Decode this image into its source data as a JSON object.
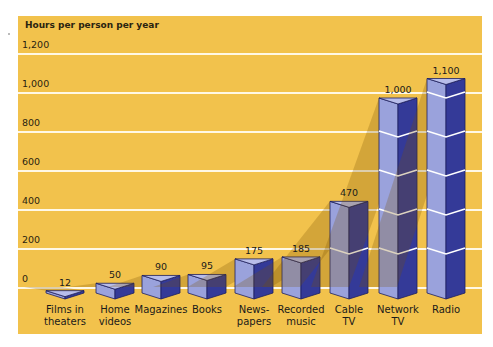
{
  "chart_data": {
    "type": "bar",
    "title": "",
    "ylabel": "Hours per person per year",
    "xlabel": "",
    "ylim": [
      0,
      1200
    ],
    "yticks": [
      "0",
      "200",
      "400",
      "600",
      "800",
      "1,000",
      "1,200"
    ],
    "grid": true,
    "categories": [
      "Films in theaters",
      "Home videos",
      "Magazines",
      "Books",
      "News-papers",
      "Recorded music",
      "Cable TV",
      "Network TV",
      "Radio"
    ],
    "values": [
      12,
      50,
      90,
      95,
      175,
      185,
      470,
      1000,
      1100
    ],
    "value_labels": [
      "12",
      "50",
      "90",
      "95",
      "175",
      "185",
      "470",
      "1,000",
      "1,100"
    ],
    "colors": {
      "background": "#f2c24c",
      "bar_light": "#a8b0e6",
      "bar_dark": "#2e3492",
      "gridline": "#fff8e6"
    }
  },
  "labels": {
    "ytitle": "Hours per person per year",
    "yticks": [
      "1,200",
      "1,000",
      "800",
      "600",
      "400",
      "200",
      "0"
    ],
    "categories": [
      [
        "Films in",
        "theaters"
      ],
      [
        "Home",
        "videos"
      ],
      [
        "Magazines",
        ""
      ],
      [
        "Books",
        ""
      ],
      [
        "News-",
        "papers"
      ],
      [
        "Recorded",
        "music"
      ],
      [
        "Cable",
        "TV"
      ],
      [
        "Network",
        "TV"
      ],
      [
        "Radio",
        ""
      ]
    ],
    "values": [
      "12",
      "50",
      "90",
      "95",
      "175",
      "185",
      "470",
      "1,000",
      "1,100"
    ]
  }
}
